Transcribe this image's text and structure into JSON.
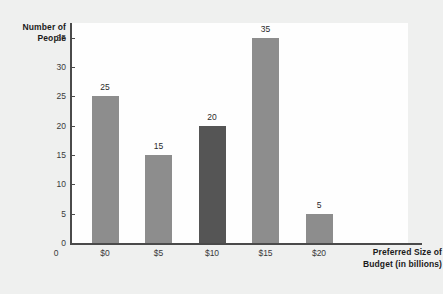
{
  "chart_data": {
    "type": "bar",
    "title": "",
    "xlabel": "Preferred Size of Budget (in billions)",
    "xlabel_line1": "Preferred Size of",
    "xlabel_line2": "Budget (in billions)",
    "ylabel": "Number of People",
    "ylabel_line1": "Number of",
    "ylabel_line2": "People",
    "categories": [
      "$0",
      "$5",
      "$10",
      "$15",
      "$20"
    ],
    "values": [
      25,
      15,
      20,
      35,
      5
    ],
    "data_labels": [
      "25",
      "15",
      "20",
      "35",
      "5"
    ],
    "bar_colors": [
      "#8d8d8d",
      "#8d8d8d",
      "#555555",
      "#8d8d8d",
      "#8d8d8d"
    ],
    "highlighted_category": "$10",
    "ylim": [
      0,
      37.5
    ],
    "yticks": [
      0,
      5,
      10,
      15,
      20,
      25,
      30,
      35
    ],
    "ytick_labels": [
      "0",
      "5",
      "10",
      "15",
      "20",
      "25",
      "30",
      "35"
    ],
    "grid": false,
    "legend": null,
    "plot_background": "#fefefe",
    "page_background": "#eff0ef",
    "axis_color": "#4a4a4a"
  }
}
